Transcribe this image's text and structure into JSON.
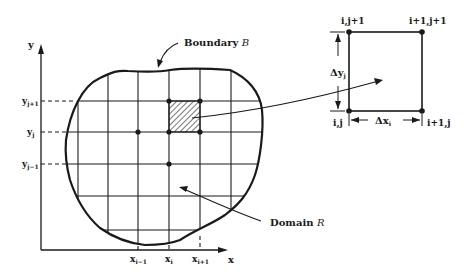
{
  "colors": {
    "ink": "#1a1a1a",
    "background": "#ffffff"
  },
  "axes": {
    "x_label": "x",
    "y_label": "y",
    "x_ticks": [
      {
        "label": "x",
        "sub": "i−1"
      },
      {
        "label": "x",
        "sub": "i"
      },
      {
        "label": "x",
        "sub": "i+1"
      }
    ],
    "y_ticks": [
      {
        "label": "y",
        "sub": "j+1"
      },
      {
        "label": "y",
        "sub": "j"
      },
      {
        "label": "y",
        "sub": "j−1"
      }
    ]
  },
  "annotations": {
    "boundary": {
      "text": "Boundary ",
      "symbol": "B"
    },
    "domain": {
      "text": "Domain ",
      "symbol": "R"
    }
  },
  "cell_detail": {
    "corners": {
      "top_left": "i,j+1",
      "top_right": "i+1,j+1",
      "bottom_left": "i,j",
      "bottom_right": "i+1,j"
    },
    "dy_label": {
      "delta": "Δy",
      "sub": "j"
    },
    "dx_label": {
      "delta": "Δx",
      "sub": "i"
    }
  }
}
